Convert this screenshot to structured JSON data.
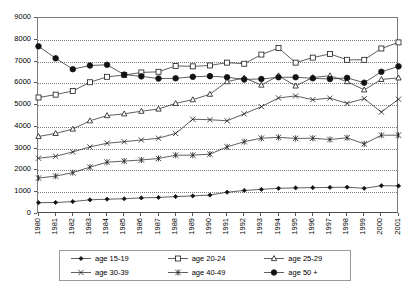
{
  "chart_data": {
    "type": "line",
    "title": "",
    "xlabel": "",
    "ylabel": "",
    "ylim": [
      0,
      9000
    ],
    "y_ticks": [
      0,
      1000,
      2000,
      3000,
      4000,
      5000,
      6000,
      7000,
      8000,
      9000
    ],
    "grid": true,
    "legend_position": "bottom",
    "x": [
      1980,
      1981,
      1982,
      1983,
      1984,
      1985,
      1986,
      1987,
      1988,
      1989,
      1990,
      1991,
      1992,
      1993,
      1994,
      1995,
      1996,
      1997,
      1998,
      1999,
      2000,
      2001
    ],
    "series": [
      {
        "name": "age 15-19",
        "marker": "small-filled-diamond",
        "values": [
          520,
          530,
          570,
          650,
          680,
          700,
          740,
          760,
          800,
          830,
          870,
          1000,
          1080,
          1130,
          1180,
          1200,
          1210,
          1220,
          1230,
          1180,
          1300,
          1290
        ]
      },
      {
        "name": "age 20-24",
        "marker": "open-square",
        "values": [
          5350,
          5480,
          5650,
          6050,
          6300,
          6380,
          6500,
          6530,
          6800,
          6780,
          6820,
          6950,
          6900,
          7320,
          7620,
          6950,
          7180,
          7350,
          7080,
          7080,
          7600,
          7880
        ]
      },
      {
        "name": "age 25-29",
        "marker": "open-triangle",
        "values": [
          3560,
          3700,
          3900,
          4280,
          4520,
          4600,
          4720,
          4820,
          5080,
          5250,
          5500,
          6080,
          6250,
          5920,
          6350,
          5880,
          6270,
          6350,
          6080,
          5700,
          6180,
          6250
        ]
      },
      {
        "name": "age 30-39",
        "marker": "x-cross",
        "values": [
          2560,
          2650,
          2850,
          3080,
          3250,
          3320,
          3400,
          3480,
          3700,
          4350,
          4330,
          4280,
          4600,
          4930,
          5330,
          5420,
          5250,
          5320,
          5080,
          5300,
          4680,
          5270
        ]
      },
      {
        "name": "age 40-49",
        "marker": "star",
        "values": [
          1650,
          1740,
          1900,
          2150,
          2380,
          2430,
          2480,
          2550,
          2700,
          2700,
          2750,
          3080,
          3320,
          3480,
          3520,
          3470,
          3480,
          3420,
          3500,
          3220,
          3620,
          3620
        ]
      },
      {
        "name": "age 50 +",
        "marker": "large-filled-circle",
        "values": [
          7700,
          7150,
          6650,
          6820,
          6850,
          6400,
          6320,
          6220,
          6230,
          6300,
          6330,
          6280,
          6180,
          6200,
          6280,
          6280,
          6230,
          6200,
          6250,
          6030,
          6530,
          6780
        ]
      }
    ]
  },
  "legend": {
    "items": [
      {
        "label": "age 15-19",
        "marker": "small-filled-diamond"
      },
      {
        "label": "age 20-24",
        "marker": "open-square"
      },
      {
        "label": "age 25-29",
        "marker": "open-triangle"
      },
      {
        "label": "age 30-39",
        "marker": "x-cross"
      },
      {
        "label": "age 40-49",
        "marker": "star"
      },
      {
        "label": "age 50 +",
        "marker": "large-filled-circle"
      }
    ]
  },
  "colors": {
    "line": "#1a1a1a",
    "grid": "#808080",
    "axis": "#5a5a5a",
    "background": "#ffffff"
  }
}
